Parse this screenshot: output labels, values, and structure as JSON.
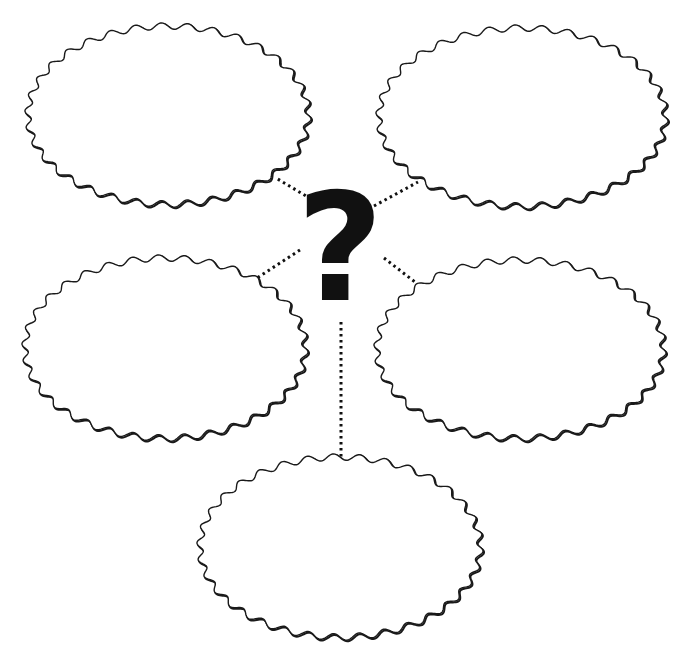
{
  "diagram": {
    "type": "bubble-map",
    "center": {
      "label": "?",
      "cx": 340,
      "cy": 245,
      "color": "#111111"
    },
    "stroke_color": "#1a1a1a",
    "connector_color": "#111111",
    "bubbles": [
      {
        "id": "top-left",
        "label": "",
        "cx": 168,
        "cy": 115,
        "rx": 140,
        "ry": 89
      },
      {
        "id": "top-right",
        "label": "",
        "cx": 522,
        "cy": 117,
        "rx": 143,
        "ry": 89
      },
      {
        "id": "middle-left",
        "label": "",
        "cx": 165,
        "cy": 348,
        "rx": 140,
        "ry": 90
      },
      {
        "id": "middle-right",
        "label": "",
        "cx": 520,
        "cy": 349,
        "rx": 143,
        "ry": 89
      },
      {
        "id": "bottom",
        "label": "",
        "cx": 340,
        "cy": 547,
        "rx": 140,
        "ry": 90
      }
    ],
    "connectors": [
      {
        "from": "center",
        "to": "top-left",
        "x1": 316,
        "y1": 202,
        "x2": 276,
        "y2": 178
      },
      {
        "from": "center",
        "to": "top-right",
        "x1": 374,
        "y1": 206,
        "x2": 418,
        "y2": 182
      },
      {
        "from": "center",
        "to": "middle-left",
        "x1": 300,
        "y1": 250,
        "x2": 257,
        "y2": 278
      },
      {
        "from": "center",
        "to": "middle-right",
        "x1": 384,
        "y1": 258,
        "x2": 415,
        "y2": 282
      },
      {
        "from": "center",
        "to": "bottom",
        "x1": 341,
        "y1": 322,
        "x2": 341,
        "y2": 458
      }
    ]
  }
}
